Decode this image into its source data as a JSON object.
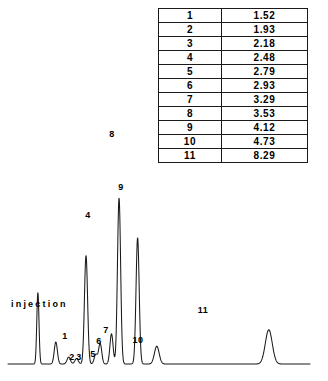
{
  "figure": {
    "kind": "chromatogram",
    "background_color": "#ffffff",
    "trace_color": "#1a1a1a",
    "injection_label": "injection"
  },
  "table": {
    "border_color": "#1a1a1a",
    "columns": [
      "peak",
      "retention_time"
    ],
    "rows": [
      {
        "peak": "1",
        "time": "1.52"
      },
      {
        "peak": "2",
        "time": "1.93"
      },
      {
        "peak": "3",
        "time": "2.18"
      },
      {
        "peak": "4",
        "time": "2.48"
      },
      {
        "peak": "5",
        "time": "2.79"
      },
      {
        "peak": "6",
        "time": "2.93"
      },
      {
        "peak": "7",
        "time": "3.29"
      },
      {
        "peak": "8",
        "time": "3.53"
      },
      {
        "peak": "9",
        "time": "4.12"
      },
      {
        "peak": "10",
        "time": "4.73"
      },
      {
        "peak": "11",
        "time": "8.29"
      }
    ]
  },
  "peak_labels": [
    {
      "id": "1",
      "text": "1",
      "x": 65,
      "y": 331,
      "rotated": false
    },
    {
      "id": "2",
      "text": "2",
      "x": 72,
      "y": 352,
      "rotated": false
    },
    {
      "id": "3",
      "text": "3",
      "x": 79,
      "y": 352,
      "rotated": false
    },
    {
      "id": "4",
      "text": "4",
      "x": 88,
      "y": 210,
      "rotated": false
    },
    {
      "id": "5",
      "text": "5",
      "x": 93,
      "y": 349,
      "rotated": false
    },
    {
      "id": "6",
      "text": "6",
      "x": 99,
      "y": 336,
      "rotated": false
    },
    {
      "id": "7",
      "text": "7",
      "x": 106,
      "y": 325,
      "rotated": false
    },
    {
      "id": "8",
      "text": "8",
      "x": 112,
      "y": 129,
      "rotated": false
    },
    {
      "id": "9",
      "text": "9",
      "x": 121,
      "y": 182,
      "rotated": false
    },
    {
      "id": "10",
      "text": "10",
      "x": 138,
      "y": 335,
      "rotated": false
    },
    {
      "id": "11",
      "text": "11",
      "x": 203,
      "y": 305,
      "rotated": false
    }
  ],
  "chart_data": {
    "type": "line",
    "title": "",
    "subtitle": "",
    "xlabel": "",
    "ylabel": "",
    "grid": false,
    "legend": "none",
    "annotations": [
      "injection"
    ],
    "xlim": [
      0.0,
      9.6
    ],
    "ylim": [
      0,
      100
    ],
    "series": [
      {
        "name": "detector response",
        "kind": "chromatogram-trace",
        "baseline": 0,
        "peaks": [
          {
            "label": "injection",
            "retention_time": 0.95,
            "height": 52,
            "width": 0.035
          },
          {
            "label": "1",
            "retention_time": 1.52,
            "height": 16,
            "width": 0.05
          },
          {
            "label": "2",
            "retention_time": 1.93,
            "height": 5,
            "width": 0.055
          },
          {
            "label": "3",
            "retention_time": 2.18,
            "height": 4,
            "width": 0.055
          },
          {
            "label": "4",
            "retention_time": 2.48,
            "height": 79,
            "width": 0.05
          },
          {
            "label": "5",
            "retention_time": 2.79,
            "height": 7,
            "width": 0.05
          },
          {
            "label": "6",
            "retention_time": 2.93,
            "height": 15,
            "width": 0.05
          },
          {
            "label": "7",
            "retention_time": 3.29,
            "height": 22,
            "width": 0.05
          },
          {
            "label": "8",
            "retention_time": 3.53,
            "height": 121,
            "width": 0.05
          },
          {
            "label": "9",
            "retention_time": 4.12,
            "height": 92,
            "width": 0.05
          },
          {
            "label": "10",
            "retention_time": 4.73,
            "height": 13,
            "width": 0.075
          },
          {
            "label": "11",
            "retention_time": 8.29,
            "height": 25,
            "width": 0.11
          }
        ]
      }
    ]
  }
}
